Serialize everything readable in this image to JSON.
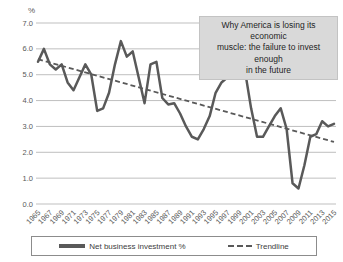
{
  "chart_data": {
    "type": "line",
    "title": "",
    "unit_label": "%",
    "xlabel": "",
    "ylabel": "%",
    "ylim": [
      0.0,
      7.0
    ],
    "ytick_step": 1.0,
    "ytick_labels": [
      "0.0",
      "1.0",
      "2.0",
      "3.0",
      "4.0",
      "5.0",
      "6.0",
      "7.0"
    ],
    "grid": "horizontal",
    "legend_position": "bottom",
    "x": [
      1965,
      1966,
      1967,
      1968,
      1969,
      1970,
      1971,
      1972,
      1973,
      1974,
      1975,
      1976,
      1977,
      1978,
      1979,
      1980,
      1981,
      1982,
      1983,
      1984,
      1985,
      1986,
      1987,
      1988,
      1989,
      1990,
      1991,
      1992,
      1993,
      1994,
      1995,
      1996,
      1997,
      1998,
      1999,
      2000,
      2001,
      2002,
      2003,
      2004,
      2005,
      2006,
      2007,
      2008,
      2009,
      2010,
      2011,
      2012,
      2013,
      2014,
      2015
    ],
    "x_tick_labels": [
      "1965",
      "1967",
      "1969",
      "1971",
      "1973",
      "1975",
      "1977",
      "1979",
      "1981",
      "1983",
      "1985",
      "1987",
      "1989",
      "1991",
      "1993",
      "1995",
      "1997",
      "1999",
      "2001",
      "2003",
      "2005",
      "2007",
      "2009",
      "2011",
      "2013",
      "2015"
    ],
    "series": [
      {
        "name": "Net business investment %",
        "style": "solid",
        "color": "#595959",
        "values": [
          5.5,
          6.0,
          5.4,
          5.2,
          5.4,
          4.7,
          4.4,
          4.9,
          5.4,
          5.0,
          3.6,
          3.7,
          4.3,
          5.4,
          6.3,
          5.7,
          5.9,
          4.9,
          3.9,
          5.4,
          5.5,
          4.1,
          3.85,
          3.9,
          3.5,
          3.0,
          2.6,
          2.5,
          2.9,
          3.4,
          4.3,
          4.7,
          4.9,
          5.2,
          5.4,
          5.1,
          3.7,
          2.6,
          2.6,
          3.0,
          3.4,
          3.7,
          2.9,
          0.8,
          0.6,
          1.5,
          2.6,
          2.7,
          3.2,
          3.0,
          3.1
        ]
      },
      {
        "name": "Trendline",
        "style": "dashed",
        "color": "#595959",
        "trend_start": 5.6,
        "trend_end": 2.4
      }
    ],
    "annotation": "Why America is losing its economic muscle: the failure to invest enough in the future",
    "annotation_lines": [
      "Why America is losing its economic",
      "muscle: the failure to invest enough",
      "in the future"
    ],
    "colors": {
      "series_line": "#595959",
      "trendline": "#595959",
      "gridline": "#bfbfbf",
      "tick_text": "#595959",
      "annotation_bg": "#d9d9d9",
      "legend_border": "#8c8c8c",
      "background": "#ffffff"
    }
  }
}
